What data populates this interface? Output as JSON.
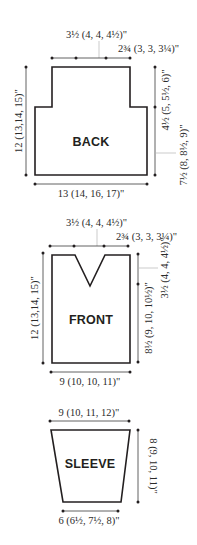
{
  "pieces": {
    "back": {
      "label": "BACK",
      "neck_width": "3½ (4, 4, 4½)\"",
      "shoulder_width": "2¾ (3, 3, 3¼)\"",
      "total_length": "12 (13,14, 15)\"",
      "armhole_depth": "4½ (5, 5½, 6)\"",
      "side_length": "7½ (8, 8½, 9)\"",
      "width": "13 (14, 16, 17)\""
    },
    "front": {
      "label": "FRONT",
      "neck_width": "3½ (4, 4, 4½)\"",
      "shoulder_width": "2¾ (3, 3, 3¼)\"",
      "total_length": "12 (13,14, 15)\"",
      "neck_depth": "3½ (4, 4, 4½)\"",
      "lower_length": "8½ (9, 10, 10½)\"",
      "width": "9 (10, 10, 11)\""
    },
    "sleeve": {
      "label": "SLEEVE",
      "top_width": "9 (10, 11, 12)\"",
      "length": "8 (9, 10, 11)\"",
      "cuff_width": "6 (6½, 7½, 8)\""
    }
  },
  "colors": {
    "outline": "#231f20",
    "leader": "#b5b5b5"
  }
}
